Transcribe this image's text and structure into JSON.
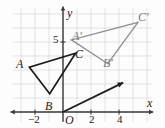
{
  "figure": {
    "kind": "coordinate-plane-geometry-diagram"
  },
  "axes": {
    "x_axis_label": "x",
    "y_axis_label": "y",
    "origin_label": "O",
    "x_ticks": [
      {
        "value": -2,
        "label": "−2"
      },
      {
        "value": 2,
        "label": "2"
      },
      {
        "value": 4,
        "label": "4"
      }
    ],
    "y_ticks": [
      {
        "value": 5,
        "label": "5"
      }
    ],
    "x_range": [
      -3.6,
      6.3
    ],
    "y_range": [
      -0.7,
      7.4
    ],
    "grid": true,
    "grid_color": "#d9d4d9",
    "axis_color": "#3a3a3a"
  },
  "colors": {
    "preimage_stroke": "#1d1d1d",
    "image_stroke": "#8d8d8d",
    "vector_stroke": "#1d1d1d",
    "label_dark": "#1b1b1b",
    "label_gray": "#7c7c7c",
    "background": "#fdfdfd"
  },
  "shapes": {
    "preimage": {
      "name": "triangle-ABC",
      "style": "dark",
      "vertices": [
        {
          "label": "A",
          "x": -2.4,
          "y": 3.2
        },
        {
          "label": "B",
          "x": -0.95,
          "y": 1.3
        },
        {
          "label": "C",
          "x": 0.9,
          "y": 4.2
        }
      ]
    },
    "image": {
      "name": "triangle-A-prime-B-prime-C-prime",
      "style": "gray",
      "vertices": [
        {
          "label": "A′",
          "x": 0.6,
          "y": 5.15
        },
        {
          "label": "B′",
          "x": 3.2,
          "y": 3.45
        },
        {
          "label": "C′",
          "x": 5.35,
          "y": 6.4
        }
      ]
    }
  },
  "vector": {
    "name": "translation-vector",
    "from": {
      "x": 0,
      "y": 0
    },
    "to": {
      "x": 4.3,
      "y": 2.1
    }
  },
  "vertex_labels": [
    {
      "key": "A",
      "text": "A",
      "tone": "dark",
      "left": 16,
      "top": 58
    },
    {
      "key": "B",
      "text": "B",
      "tone": "dark",
      "left": 45,
      "top": 100
    },
    {
      "key": "C",
      "text": "C",
      "tone": "dark",
      "left": 75,
      "top": 48
    },
    {
      "key": "A-prime",
      "text": "A′",
      "tone": "gray",
      "left": 72,
      "top": 30
    },
    {
      "key": "B-prime",
      "text": "B′",
      "tone": "gray",
      "left": 103,
      "top": 57
    },
    {
      "key": "C-prime",
      "text": "C′",
      "tone": "gray",
      "left": 138,
      "top": 11
    }
  ],
  "axis_labels": [
    {
      "key": "y-axis",
      "text": "y",
      "tone": "dark",
      "left": 67,
      "top": 7
    },
    {
      "key": "x-axis",
      "text": "x",
      "tone": "dark",
      "left": 147,
      "top": 97
    },
    {
      "key": "origin",
      "text": "O",
      "tone": "dark",
      "left": 65,
      "top": 114
    },
    {
      "key": "y-5",
      "text": "5",
      "tone": "dark",
      "left": 53,
      "top": 34
    },
    {
      "key": "x-neg2",
      "text": "−2",
      "tone": "dark",
      "left": 28,
      "top": 114
    },
    {
      "key": "x-2",
      "text": "2",
      "tone": "dark",
      "left": 89,
      "top": 114
    },
    {
      "key": "x-4",
      "text": "4",
      "tone": "dark",
      "left": 117,
      "top": 114
    }
  ]
}
